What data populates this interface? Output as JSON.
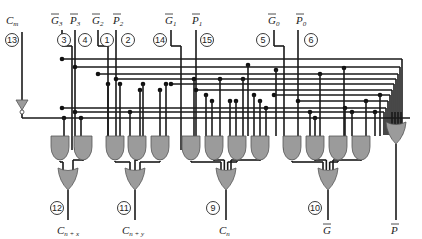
{
  "colors": {
    "wire": "#1a1a1a",
    "gate_fill": "#9b9b9b",
    "gate_stroke": "#555555",
    "background": "#ffffff"
  },
  "inputs": [
    {
      "id": "cm",
      "label": "C",
      "sub": "m",
      "bar": false,
      "pin": "13",
      "x": 22,
      "lx": 6,
      "px": 12
    },
    {
      "id": "g3",
      "label": "G",
      "sub": "3",
      "bar": true,
      "pin": "3",
      "x": 62,
      "lx": 51,
      "px": 64
    },
    {
      "id": "p3",
      "label": "P",
      "sub": "3",
      "bar": true,
      "pin": "4",
      "x": 75,
      "lx": 70,
      "px": 85
    },
    {
      "id": "g2",
      "label": "G",
      "sub": "2",
      "bar": true,
      "pin": "1",
      "x": 98,
      "lx": 92,
      "px": 107
    },
    {
      "id": "p2",
      "label": "P",
      "sub": "2",
      "bar": true,
      "pin": "2",
      "x": 116,
      "lx": 113,
      "px": 128
    },
    {
      "id": "g1",
      "label": "G",
      "sub": "1",
      "bar": true,
      "pin": "14",
      "x": 171,
      "lx": 165,
      "px": 160
    },
    {
      "id": "p1",
      "label": "P",
      "sub": "1",
      "bar": true,
      "pin": "15",
      "x": 196,
      "lx": 192,
      "px": 207
    },
    {
      "id": "g0",
      "label": "G",
      "sub": "0",
      "bar": true,
      "pin": "5",
      "x": 274,
      "lx": 268,
      "px": 263
    },
    {
      "id": "p0",
      "label": "P",
      "sub": "0",
      "bar": true,
      "pin": "6",
      "x": 298,
      "lx": 296,
      "px": 311
    }
  ],
  "outputs": [
    {
      "id": "cnx",
      "label": "C",
      "sub": "n + x",
      "bar": false,
      "pin": "12",
      "x": 68,
      "lx": 57,
      "px": 57
    },
    {
      "id": "cny",
      "label": "C",
      "sub": "n + y",
      "bar": false,
      "pin": "11",
      "x": 135,
      "lx": 122,
      "px": 124
    },
    {
      "id": "cn",
      "label": "C",
      "sub": "n",
      "bar": false,
      "pin": "9",
      "x": 226,
      "lx": 219,
      "px": 213
    },
    {
      "id": "g",
      "label": "G",
      "sub": "",
      "bar": true,
      "pin": "10",
      "x": 328,
      "lx": 323,
      "px": 315
    },
    {
      "id": "p",
      "label": "P",
      "sub": "",
      "bar": true,
      "pin": "",
      "x": 396,
      "lx": 391,
      "px": 0
    }
  ],
  "and_gates": [
    {
      "x": 60,
      "inputs": 2
    },
    {
      "x": 83,
      "inputs": 2
    },
    {
      "x": 115,
      "inputs": 2
    },
    {
      "x": 137,
      "inputs": 3
    },
    {
      "x": 160,
      "inputs": 3
    },
    {
      "x": 191,
      "inputs": 2
    },
    {
      "x": 214,
      "inputs": 4
    },
    {
      "x": 237,
      "inputs": 4
    },
    {
      "x": 260,
      "inputs": 3
    },
    {
      "x": 292,
      "inputs": 2
    },
    {
      "x": 315,
      "inputs": 3
    },
    {
      "x": 338,
      "inputs": 4
    },
    {
      "x": 361,
      "inputs": 4
    }
  ],
  "or_gates": [
    {
      "x": 68,
      "y": 168,
      "from": [
        0,
        1
      ],
      "out": "cnx"
    },
    {
      "x": 135,
      "y": 168,
      "from": [
        2,
        3,
        4
      ],
      "out": "cny"
    },
    {
      "x": 226,
      "y": 168,
      "from": [
        5,
        6,
        7,
        8
      ],
      "out": "cn"
    },
    {
      "x": 328,
      "y": 168,
      "from": [
        9,
        10,
        11,
        12
      ],
      "out": "g"
    },
    {
      "x": 396,
      "y": 122,
      "from": [],
      "out": "p"
    }
  ],
  "bus_lines_y": [
    59,
    67,
    74,
    79,
    84,
    90,
    95,
    101,
    108,
    112
  ],
  "inverter": {
    "x": 22,
    "y": 100
  }
}
